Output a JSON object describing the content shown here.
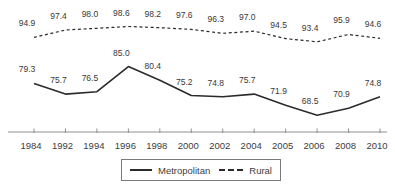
{
  "chart_data": {
    "type": "line",
    "title": "",
    "xlabel": "",
    "ylabel": "",
    "categories": [
      "1984",
      "1992",
      "1994",
      "1996",
      "1998",
      "2000",
      "2002",
      "2004",
      "2005",
      "2006",
      "2008",
      "2010"
    ],
    "series": [
      {
        "name": "Metropolitan",
        "line_style": "solid",
        "color": "#2b2b2b",
        "values": [
          79.3,
          75.7,
          76.5,
          85.0,
          80.4,
          75.2,
          74.8,
          75.7,
          71.9,
          68.5,
          70.9,
          74.8
        ]
      },
      {
        "name": "Rural",
        "line_style": "dashed",
        "color": "#2b2b2b",
        "values": [
          94.9,
          97.4,
          98.0,
          98.6,
          98.2,
          97.6,
          96.3,
          97.0,
          94.5,
          93.4,
          95.9,
          94.6
        ]
      }
    ],
    "point_labels_shown": true,
    "point_label_decimals": 1,
    "ylim": [
      66,
      100
    ],
    "grid": false,
    "y_axis_shown": false,
    "legend_position": "bottom-center",
    "axis_color": "#909090",
    "tick_label_color": "#3d3d3d",
    "point_label_color": "#383838"
  }
}
